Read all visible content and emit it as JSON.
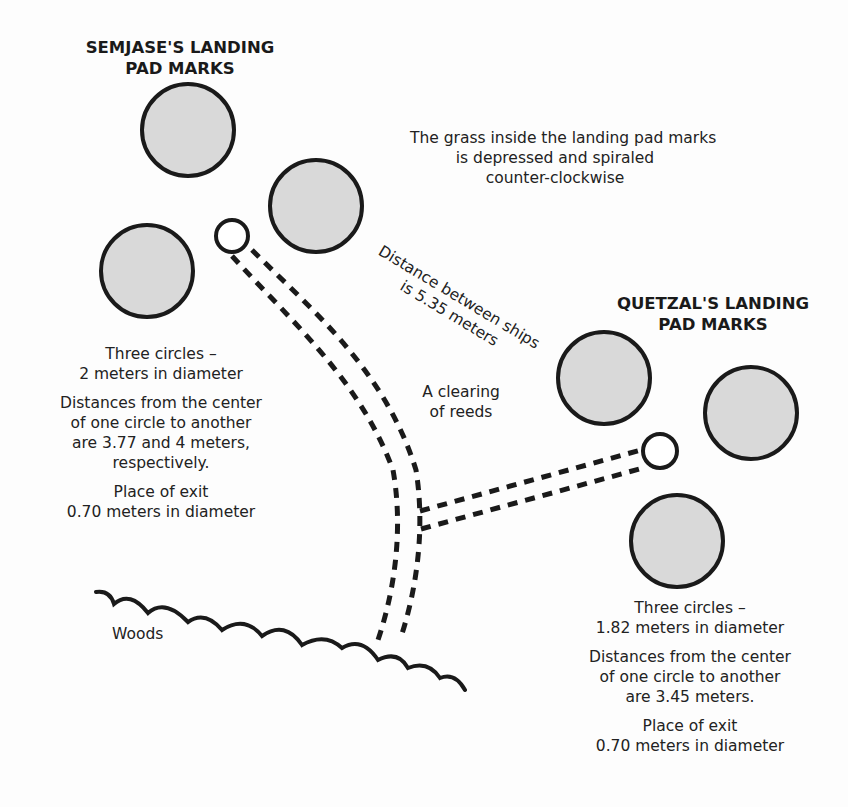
{
  "semjase": {
    "title_line1": "SEMJASE'S LANDING",
    "title_line2": "PAD MARKS",
    "circles_line1": "Three circles –",
    "circles_line2": "2 meters in diameter",
    "distances_line1": "Distances from the center",
    "distances_line2": "of one circle to another",
    "distances_line3": "are 3.77 and 4 meters,",
    "distances_line4": "respectively.",
    "exit_line1": "Place of exit",
    "exit_line2": "0.70 meters in diameter"
  },
  "quetzal": {
    "title_line1": "QUETZAL'S LANDING",
    "title_line2": "PAD MARKS",
    "circles_line1": "Three circles –",
    "circles_line2": "1.82 meters in diameter",
    "distances_line1": "Distances from the center",
    "distances_line2": "of one circle to another",
    "distances_line3": "are 3.45 meters.",
    "exit_line1": "Place of exit",
    "exit_line2": "0.70 meters in diameter"
  },
  "grass_note": {
    "line1": "The grass inside the landing pad marks",
    "line2": "is depressed and spiraled",
    "line3": "counter-clockwise"
  },
  "distance_note": {
    "line1": "Distance between ships",
    "line2": "is 5.35 meters"
  },
  "clearing_label": {
    "line1": "A clearing",
    "line2": "of reeds"
  },
  "woods_label": "Woods",
  "colors": {
    "pad_fill": "#d9d9d9",
    "stroke": "#1a1a1a",
    "background": "#fdfdfd"
  }
}
